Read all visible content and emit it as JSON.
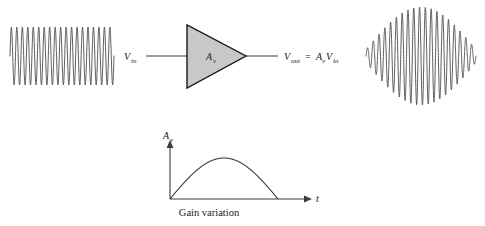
{
  "figure": {
    "colors": {
      "stroke": "#3c3c3c",
      "wave_stroke": "#4a4a4a",
      "amp_fill": "#c8c8c8",
      "amp_stroke": "#1a1a1a",
      "background": "#ffffff",
      "text": "#1a1a1a"
    }
  },
  "input_signal": {
    "name": "input-waveform",
    "type": "constant-amplitude-sine",
    "cycles": 19,
    "x_start": 10,
    "x_end": 114,
    "baseline_y": 56,
    "amplitude": 29
  },
  "amplifier": {
    "symbol_label": "A",
    "symbol_subscript": "v",
    "input_label": "V",
    "input_subscript": "in",
    "output_label_main": "V",
    "output_subscript": "out",
    "output_equals": "=",
    "output_gain": "A",
    "output_gain_subscript": "v",
    "output_signal": "V",
    "output_signal_subscript": "in"
  },
  "output_signal": {
    "name": "output-waveform",
    "type": "sine-with-half-sine-envelope",
    "cycles": 19,
    "x_start": 366,
    "x_end": 476,
    "baseline_y": 56,
    "max_amplitude": 49
  },
  "gain_plot": {
    "y_axis_label": "A",
    "y_axis_subscript": "v",
    "x_axis_label": "t",
    "caption": "Gain variation",
    "chart_type": "line",
    "curve": "half-sine",
    "origin_x": 170,
    "origin_y": 199,
    "curve_end_x": 278,
    "peak_x": 224,
    "peak_y": 158,
    "x_axis_end": 312,
    "y_axis_top": 140
  },
  "chart_data": {
    "type": "line",
    "title": "Gain variation",
    "xlabel": "t",
    "ylabel": "Av",
    "grid": false,
    "legend": "none",
    "x": [
      0,
      0.1,
      0.2,
      0.3,
      0.4,
      0.5,
      0.6,
      0.7,
      0.8,
      0.9,
      1.0
    ],
    "values": [
      0,
      0.309,
      0.588,
      0.809,
      0.951,
      1.0,
      0.951,
      0.809,
      0.588,
      0.309,
      0
    ],
    "xlim": [
      0,
      1.3
    ],
    "ylim": [
      0,
      1.15
    ],
    "annotations": [
      "Gain variation"
    ]
  }
}
